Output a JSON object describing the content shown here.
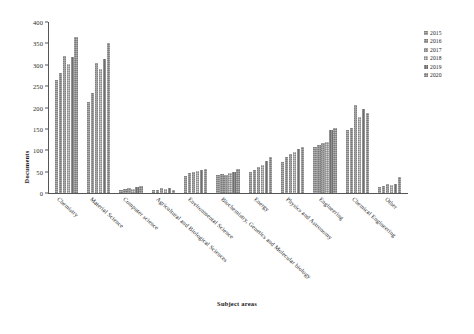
{
  "chart_data": {
    "type": "bar",
    "title": "",
    "xlabel": "Subject areas",
    "ylabel": "Documents",
    "ylim": [
      0,
      400
    ],
    "yticks": [
      0,
      50,
      100,
      150,
      200,
      250,
      300,
      350,
      400
    ],
    "grid": false,
    "legend_position": "right",
    "categories": [
      "Chemistry",
      "Material Science",
      "Computer science",
      "Agricultural and Biological Sciences",
      "Environmental Science",
      "Biochemistry, Genetics and Molecular biology",
      "Energy",
      "Physics and Astronomy",
      "Engineering",
      "Chemical Engineering",
      "Other"
    ],
    "series": [
      {
        "name": "2015",
        "values": [
          264,
          212,
          6,
          7,
          40,
          41,
          48,
          72,
          108,
          148,
          14
        ]
      },
      {
        "name": "2016",
        "values": [
          281,
          235,
          9,
          8,
          47,
          44,
          55,
          85,
          112,
          153,
          16
        ]
      },
      {
        "name": "2017",
        "values": [
          321,
          303,
          11,
          12,
          50,
          42,
          60,
          92,
          118,
          205,
          20
        ]
      },
      {
        "name": "2018",
        "values": [
          301,
          289,
          10,
          9,
          52,
          47,
          66,
          95,
          120,
          178,
          18
        ]
      },
      {
        "name": "2019",
        "values": [
          317,
          314,
          13,
          11,
          53,
          50,
          74,
          103,
          148,
          196,
          22
        ]
      },
      {
        "name": "2020",
        "values": [
          365,
          352,
          17,
          6,
          56,
          56,
          84,
          108,
          152,
          188,
          38
        ]
      }
    ]
  },
  "legend": {
    "items": [
      {
        "label": "2015"
      },
      {
        "label": "2016"
      },
      {
        "label": "2017"
      },
      {
        "label": "2018"
      },
      {
        "label": "2019"
      },
      {
        "label": "2020"
      }
    ]
  }
}
